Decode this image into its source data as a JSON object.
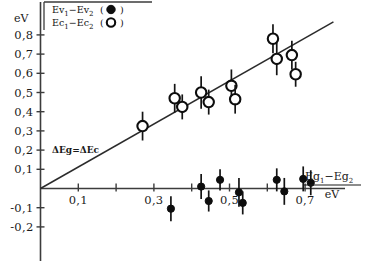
{
  "axes": {
    "y_unit": "eV",
    "y_ticks": [
      "0,8",
      "0,7",
      "0,6",
      "0,5",
      "0,4",
      "0,3",
      "0,2",
      "0,1",
      "-0,1",
      "-0,2"
    ],
    "x_ticks": [
      "0,1",
      "0,3",
      "0,5",
      "0,7"
    ],
    "x_label_numerator": "Eg",
    "x_label_num_sub1": "1",
    "x_label_minus": "−Eg",
    "x_label_num_sub2": "2",
    "x_label_denominator": "eV"
  },
  "legend": {
    "entry1_main": "Ev",
    "entry1_sub1": "1",
    "entry1_mid": "−Ev",
    "entry1_sub2": "2",
    "entry1_marker": "(●)",
    "entry2_main": "Ec",
    "entry2_sub1": "1",
    "entry2_mid": "−Ec",
    "entry2_sub2": "2",
    "entry2_marker": "(○)"
  },
  "annotation": {
    "identity_line": "ΔEg=ΔEc"
  },
  "colors": {
    "marker": "#0d0d0d",
    "axis": "#3c3c3c",
    "line": "#2b2b2b",
    "background": "#ffffff"
  },
  "chart_data": {
    "type": "scatter",
    "title": "",
    "xlabel": "Eg1-Eg2 / eV",
    "ylabel": "eV",
    "xlim": [
      0,
      0.78
    ],
    "ylim": [
      -0.25,
      0.88
    ],
    "grid": false,
    "legend_position": "top-left",
    "reference_lines": [
      {
        "label": "ΔEg=ΔEc",
        "type": "diagonal",
        "slope": 1.12,
        "intercept": 0.0
      },
      {
        "label": "zero",
        "type": "horizontal",
        "slope": 0.0,
        "intercept": 0.0
      }
    ],
    "series": [
      {
        "name": "Ec1-Ec2",
        "marker": "open-circle",
        "points": [
          {
            "x": 0.27,
            "y": 0.325,
            "yerr": 0.075
          },
          {
            "x": 0.355,
            "y": 0.47,
            "yerr": 0.075
          },
          {
            "x": 0.375,
            "y": 0.425,
            "yerr": 0.065
          },
          {
            "x": 0.425,
            "y": 0.5,
            "yerr": 0.085
          },
          {
            "x": 0.445,
            "y": 0.45,
            "yerr": 0.065
          },
          {
            "x": 0.505,
            "y": 0.535,
            "yerr": 0.085
          },
          {
            "x": 0.515,
            "y": 0.465,
            "yerr": 0.075
          },
          {
            "x": 0.615,
            "y": 0.78,
            "yerr": 0.075
          },
          {
            "x": 0.625,
            "y": 0.675,
            "yerr": 0.085
          },
          {
            "x": 0.665,
            "y": 0.695,
            "yerr": 0.075
          },
          {
            "x": 0.675,
            "y": 0.595,
            "yerr": 0.065
          }
        ]
      },
      {
        "name": "Ev1-Ev2",
        "marker": "filled-circle",
        "points": [
          {
            "x": 0.345,
            "y": -0.105,
            "yerr": 0.065
          },
          {
            "x": 0.425,
            "y": 0.01,
            "yerr": 0.065
          },
          {
            "x": 0.445,
            "y": -0.065,
            "yerr": 0.055
          },
          {
            "x": 0.475,
            "y": 0.045,
            "yerr": 0.055
          },
          {
            "x": 0.525,
            "y": -0.02,
            "yerr": 0.075
          },
          {
            "x": 0.535,
            "y": -0.075,
            "yerr": 0.06
          },
          {
            "x": 0.625,
            "y": 0.045,
            "yerr": 0.06
          },
          {
            "x": 0.645,
            "y": -0.015,
            "yerr": 0.07
          },
          {
            "x": 0.695,
            "y": 0.05,
            "yerr": 0.065
          },
          {
            "x": 0.715,
            "y": 0.03,
            "yerr": 0.065
          }
        ]
      }
    ]
  }
}
